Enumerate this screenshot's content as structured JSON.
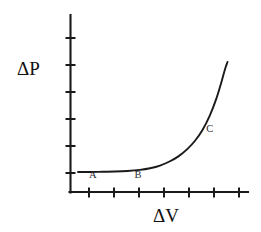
{
  "figure": {
    "background_color": "#ffffff",
    "ink_color": "#1a1a1a",
    "label_color": "#2b2b2b"
  },
  "axis_titles": {
    "y_label": "ΔP",
    "x_label": "ΔV"
  },
  "curve_labels": {
    "a": "A",
    "b": "B",
    "c": "C"
  },
  "chart_data": {
    "type": "line",
    "title": "",
    "subtitle": "",
    "xlabel": "ΔV",
    "ylabel": "ΔP",
    "xlim": [
      0,
      7.12
    ],
    "ylim": [
      0,
      6.56
    ],
    "grid": false,
    "legend": null,
    "axis_style": {
      "x_axis_visible": true,
      "y_axis_visible": true,
      "x_tick_count": 7,
      "y_tick_count": 6,
      "tick_labels_shown": false,
      "x_tick_values": [
        1,
        2,
        3,
        4,
        5,
        6,
        7
      ],
      "y_tick_values": [
        1,
        2,
        3,
        4,
        5,
        6
      ]
    },
    "series": [
      {
        "name": "compliance-curve",
        "x": [
          0.32,
          0.8,
          1.3,
          1.8,
          2.3,
          2.8,
          3.2,
          3.6,
          4.0,
          4.35,
          4.7,
          5.0,
          5.3,
          5.6,
          5.85,
          6.05,
          6.2,
          6.3
        ],
        "y": [
          0.74,
          0.74,
          0.75,
          0.76,
          0.78,
          0.82,
          0.88,
          0.98,
          1.14,
          1.33,
          1.6,
          1.9,
          2.3,
          2.85,
          3.45,
          4.05,
          4.55,
          4.82
        ]
      }
    ],
    "annotations": [
      {
        "text": "A",
        "x": 0.76,
        "y": 0.52,
        "describes": "flat low-slope region start"
      },
      {
        "text": "B",
        "x": 2.58,
        "y": 0.52,
        "describes": "flat low-slope region end"
      },
      {
        "text": "C",
        "x": 5.45,
        "y": 2.22,
        "describes": "steep rising region"
      }
    ]
  },
  "geometry": {
    "origin_x": 70,
    "origin_y": 192,
    "y_axis_top": 15,
    "x_axis_right": 248,
    "y_tick_positions": [
      38,
      65,
      92,
      119,
      146,
      173
    ],
    "x_tick_positions": [
      89,
      114,
      139,
      164,
      189,
      214,
      239
    ],
    "tick_half_length": 5,
    "curve_path": "M 78,172.4 L 96,172.3 L 114,172.1 L 130,171.7 L 142,171.0 L 152,170.0 L 161,168.6 L 169,166.7 L 176,164.4 L 183,161.3 L 189,157.6 L 195,152.6 L 200,146.8 L 205,139.4 L 209,131.6 L 213,121.0 L 216,109.0 L 218,97.0 L 219.6,84.0 L 220.6,72.0 L 221,62.5"
  }
}
